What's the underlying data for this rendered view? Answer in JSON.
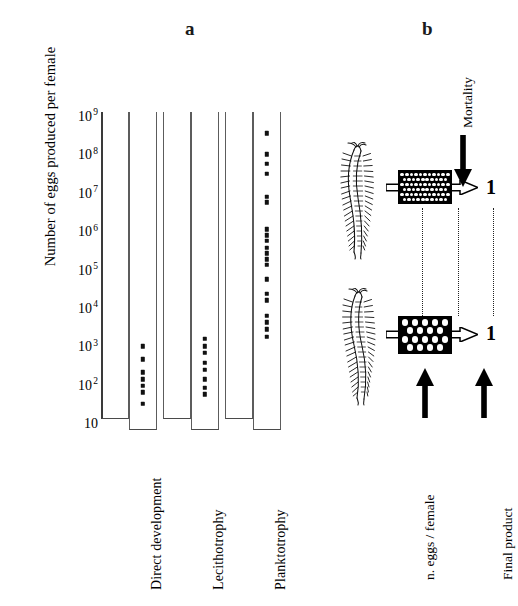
{
  "figure": {
    "panels": [
      {
        "id": "a",
        "label": "a"
      },
      {
        "id": "b",
        "label": "b"
      }
    ]
  },
  "panel_a": {
    "axis_title_y": "Number of eggs produced per female",
    "y_ticks": [
      {
        "mantissa": "10",
        "exponent": "9",
        "decade": 9
      },
      {
        "mantissa": "10",
        "exponent": "8",
        "decade": 8
      },
      {
        "mantissa": "10",
        "exponent": "7",
        "decade": 7
      },
      {
        "mantissa": "10",
        "exponent": "6",
        "decade": 6
      },
      {
        "mantissa": "10",
        "exponent": "5",
        "decade": 5
      },
      {
        "mantissa": "10",
        "exponent": "4",
        "decade": 4
      },
      {
        "mantissa": "10",
        "exponent": "3",
        "decade": 3
      },
      {
        "mantissa": "10",
        "exponent": "2",
        "decade": 2
      },
      {
        "mantissa": "10",
        "exponent": "",
        "decade": 1
      }
    ],
    "categories": [
      "Direct development",
      "Lecithotrophy",
      "Planktotrophy"
    ]
  },
  "panel_b": {
    "mortality_label": "Mortality",
    "eggs_label": "n. eggs / female",
    "final_product_label": "Final product",
    "final_count_top": "1",
    "final_count_bottom": "1",
    "rows": [
      {
        "organism": "polychaete-worm",
        "egg_pattern": "many-small-eggs",
        "egg_columns": 11,
        "egg_rows": 6,
        "final_product": "1"
      },
      {
        "organism": "polychaete-worm",
        "egg_pattern": "few-large-eggs",
        "egg_columns": 5,
        "egg_rows": 4,
        "final_product": "1"
      }
    ]
  },
  "chart_data": {
    "type": "scatter",
    "title": "",
    "xlabel": "",
    "ylabel": "Number of eggs produced per female",
    "y_scale": "log10",
    "ylim": [
      1,
      1000000000
    ],
    "y_tick_values": [
      1,
      100,
      1000,
      10000,
      100000,
      1000000,
      10000000,
      100000000,
      1000000000
    ],
    "y_tick_labels": [
      "10",
      "10 2",
      "10 3",
      "10 4",
      "10 5",
      "10 6",
      "10 7",
      "10 8",
      "10 9"
    ],
    "grid": false,
    "legend": "none",
    "categories": [
      "Direct development",
      "Lecithotrophy",
      "Planktotrophy"
    ],
    "series": [
      {
        "name": "Direct development",
        "log10_values": [
          3.05,
          2.72,
          2.38,
          2.2,
          2.03,
          1.86,
          1.55
        ]
      },
      {
        "name": "Lecithotrophy",
        "log10_values": [
          3.25,
          3.05,
          2.88,
          2.62,
          2.45,
          2.2,
          1.98,
          1.8
        ]
      },
      {
        "name": "Planktotrophy",
        "log10_values": [
          8.6,
          8.05,
          7.8,
          7.55,
          6.95,
          6.8,
          6.1,
          5.95,
          5.8,
          5.62,
          5.48,
          5.32,
          5.18,
          4.8,
          4.42,
          4.25,
          3.85,
          3.68,
          3.5,
          3.3
        ]
      }
    ]
  }
}
